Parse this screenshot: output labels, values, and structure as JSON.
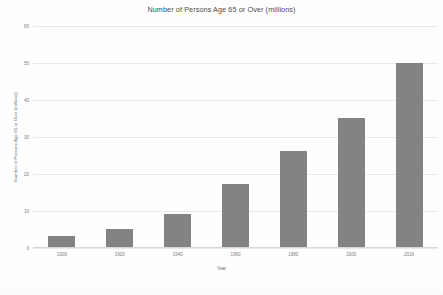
{
  "chart_data": {
    "type": "bar",
    "title": "Number of Persons Age 65 or Over (millions)",
    "xlabel": "Year",
    "ylabel": "Number of Persons Age 65 or Over (millions)",
    "categories": [
      "1900",
      "1920",
      "1940",
      "1960",
      "1980",
      "2000",
      "2016"
    ],
    "values": [
      3,
      5,
      9,
      17,
      26,
      35,
      50
    ],
    "ylim": [
      0,
      60
    ],
    "yticks": [
      0,
      10,
      20,
      30,
      40,
      50,
      60
    ],
    "ytick_labels": [
      "0",
      "10",
      "20",
      "30",
      "40",
      "50",
      "60"
    ],
    "grid": true,
    "legend": false,
    "series": [
      {
        "name": "Persons Age 65 or Over",
        "color": "#787878",
        "values": [
          3,
          5,
          9,
          17,
          26,
          35,
          50
        ]
      }
    ]
  },
  "colors": {
    "bar": "#787878",
    "gridline": "#e9e9e9",
    "axis": "#d8d8d8",
    "title_text": "#4a4a4a",
    "tick_text": "#7d7d7d",
    "background": "#fefefe"
  }
}
